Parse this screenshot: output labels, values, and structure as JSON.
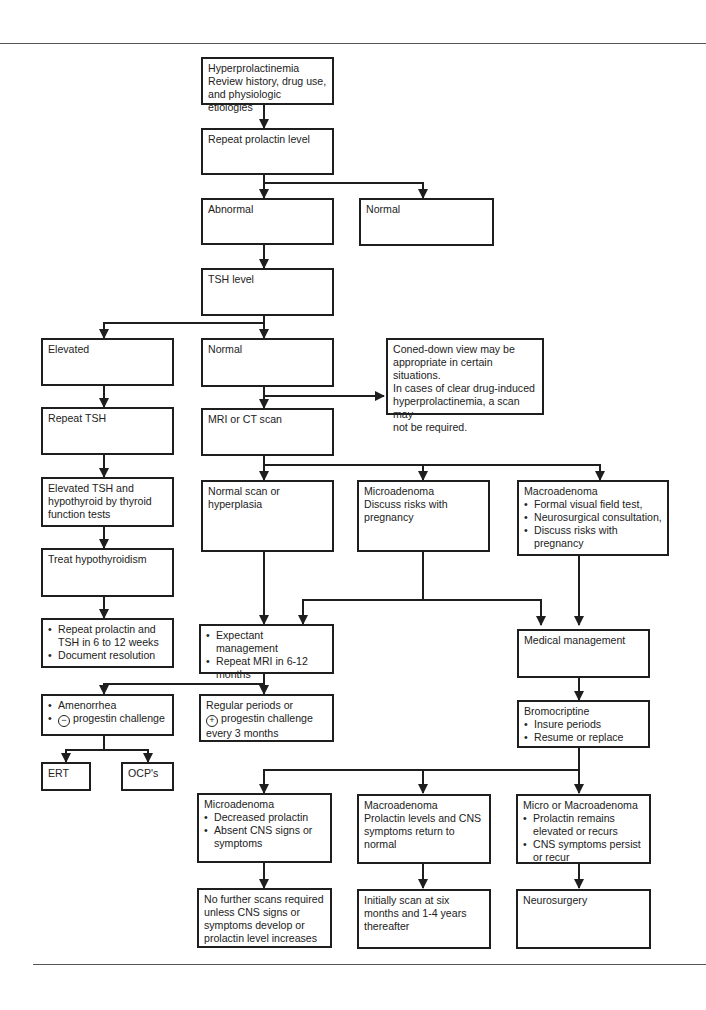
{
  "flowchart": {
    "title": "Hyperprolactinemia evaluation and management algorithm",
    "nodes": {
      "start": {
        "lines": [
          "Hyperprolactinemia",
          "Review history, drug use,",
          "and physiologic etiologies"
        ]
      },
      "repeat_prolactin": {
        "lines": [
          "Repeat prolactin level"
        ]
      },
      "abnormal": {
        "lines": [
          "Abnormal"
        ]
      },
      "normal_prolactin": {
        "lines": [
          "Normal"
        ]
      },
      "tsh_level": {
        "lines": [
          "TSH level"
        ]
      },
      "elevated": {
        "lines": [
          "Elevated"
        ]
      },
      "normal_tsh": {
        "lines": [
          "Normal"
        ]
      },
      "coned_down_note": {
        "lines": [
          "Coned-down view may be",
          "appropriate in certain situations.",
          "In cases of clear drug-induced",
          "hyperprolactinemia, a scan may",
          "not be required."
        ]
      },
      "repeat_tsh": {
        "lines": [
          "Repeat TSH"
        ]
      },
      "mri_ct": {
        "lines": [
          "MRI or CT scan"
        ]
      },
      "elevated_tsh_hypothyroid": {
        "lines": [
          "Elevated TSH and",
          "hypothyroid by thyroid",
          "function tests"
        ]
      },
      "normal_scan": {
        "lines": [
          "Normal scan or",
          "hyperplasia"
        ]
      },
      "microadenoma_dx": {
        "lines": [
          "Microadenoma",
          "Discuss risks with",
          "pregnancy"
        ]
      },
      "macroadenoma_dx": {
        "title": "Macroadenoma",
        "bullets": [
          "Formal visual field test,",
          "Neurosurgical consultation,",
          "Discuss risks with pregnancy"
        ]
      },
      "treat_hypothyroidism": {
        "lines": [
          "Treat hypothyroidism"
        ]
      },
      "repeat_prolactin_tsh": {
        "bullets": [
          "Repeat prolactin and TSH in 6 to 12 weeks",
          "Document resolution"
        ]
      },
      "expectant_management": {
        "bullets": [
          "Expectant management",
          "Repeat MRI in 6-12 months"
        ]
      },
      "medical_management": {
        "lines": [
          "Medical management"
        ]
      },
      "amenorrhea": {
        "bullets": [
          "Amenorrhea",
          "progestin challenge"
        ],
        "symbol": "−"
      },
      "regular_periods": {
        "lines": [
          "Regular periods or",
          "progestin challenge",
          "every 3 months"
        ],
        "symbol": "+"
      },
      "bromocriptine": {
        "title": "Bromocriptine",
        "bullets": [
          "Insure periods",
          "Resume or replace"
        ]
      },
      "ert": {
        "lines": [
          "ERT"
        ]
      },
      "ocps": {
        "lines": [
          "OCP's"
        ]
      },
      "microadenoma_followup": {
        "title": "Microadenoma",
        "bullets": [
          "Decreased prolactin",
          "Absent CNS signs or symptoms"
        ]
      },
      "macroadenoma_followup": {
        "lines": [
          "Macroadenoma",
          "Prolactin levels and CNS",
          "symptoms return to",
          "normal"
        ]
      },
      "micro_or_macro": {
        "title": "Micro or Macroadenoma",
        "bullets": [
          "Prolactin remains elevated or recurs",
          "CNS symptoms persist or recur"
        ]
      },
      "no_further_scans": {
        "lines": [
          "No further scans required",
          "unless CNS signs or",
          "symptoms develop or",
          "prolactin level increases"
        ]
      },
      "initially_scan": {
        "lines": [
          "Initially scan at six",
          "months and 1-4 years",
          "thereafter"
        ]
      },
      "neurosurgery": {
        "lines": [
          "Neurosurgery"
        ]
      }
    },
    "edges": [
      [
        "start",
        "repeat_prolactin"
      ],
      [
        "repeat_prolactin",
        "abnormal"
      ],
      [
        "repeat_prolactin",
        "normal_prolactin"
      ],
      [
        "abnormal",
        "tsh_level"
      ],
      [
        "tsh_level",
        "elevated"
      ],
      [
        "tsh_level",
        "normal_tsh"
      ],
      [
        "normal_tsh",
        "mri_ct"
      ],
      [
        "normal_tsh",
        "coned_down_note"
      ],
      [
        "elevated",
        "repeat_tsh"
      ],
      [
        "repeat_tsh",
        "elevated_tsh_hypothyroid"
      ],
      [
        "elevated_tsh_hypothyroid",
        "treat_hypothyroidism"
      ],
      [
        "treat_hypothyroidism",
        "repeat_prolactin_tsh"
      ],
      [
        "mri_ct",
        "normal_scan"
      ],
      [
        "mri_ct",
        "microadenoma_dx"
      ],
      [
        "mri_ct",
        "macroadenoma_dx"
      ],
      [
        "normal_scan",
        "expectant_management"
      ],
      [
        "microadenoma_dx",
        "expectant_management"
      ],
      [
        "microadenoma_dx",
        "medical_management"
      ],
      [
        "macroadenoma_dx",
        "medical_management"
      ],
      [
        "expectant_management",
        "amenorrhea"
      ],
      [
        "expectant_management",
        "regular_periods"
      ],
      [
        "amenorrhea",
        "ert"
      ],
      [
        "amenorrhea",
        "ocps"
      ],
      [
        "medical_management",
        "bromocriptine"
      ],
      [
        "bromocriptine",
        "microadenoma_followup"
      ],
      [
        "bromocriptine",
        "macroadenoma_followup"
      ],
      [
        "bromocriptine",
        "micro_or_macro"
      ],
      [
        "microadenoma_followup",
        "no_further_scans"
      ],
      [
        "macroadenoma_followup",
        "initially_scan"
      ],
      [
        "micro_or_macro",
        "neurosurgery"
      ]
    ]
  }
}
